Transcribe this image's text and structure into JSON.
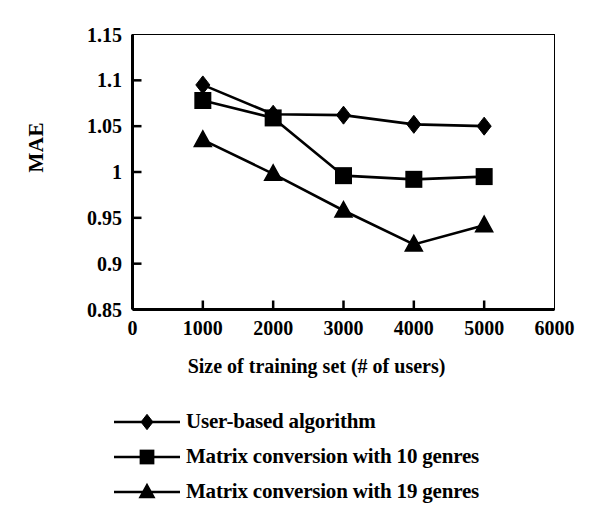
{
  "chart_data": {
    "type": "line",
    "title": "",
    "xlabel": "Size of training set (# of users)",
    "ylabel": "MAE",
    "x": [
      1000,
      2000,
      3000,
      4000,
      5000
    ],
    "xlim": [
      0,
      6000
    ],
    "ylim": [
      0.85,
      1.15
    ],
    "xticks": [
      "0",
      "1000",
      "2000",
      "3000",
      "4000",
      "5000",
      "6000"
    ],
    "xtick_values": [
      0,
      1000,
      2000,
      3000,
      4000,
      5000,
      6000
    ],
    "yticks": [
      "0.85",
      "0.9",
      "0.95",
      "1",
      "1.05",
      "1.1",
      "1.15"
    ],
    "ytick_values": [
      0.85,
      0.9,
      0.95,
      1.0,
      1.05,
      1.1,
      1.15
    ],
    "grid": false,
    "legend_position": "below",
    "series": [
      {
        "name": "User-based algorithm",
        "marker": "diamond",
        "color": "#000000",
        "values": [
          1.095,
          1.063,
          1.062,
          1.052,
          1.05
        ]
      },
      {
        "name": "Matrix conversion with 10 genres",
        "marker": "square",
        "color": "#000000",
        "values": [
          1.078,
          1.059,
          0.996,
          0.992,
          0.995
        ]
      },
      {
        "name": "Matrix conversion with 19 genres",
        "marker": "triangle",
        "color": "#000000",
        "values": [
          1.035,
          0.998,
          0.958,
          0.921,
          0.942
        ]
      }
    ]
  },
  "axes": {
    "y_title": "MAE",
    "x_title": "Size of training set (# of users)",
    "y_tick_labels": [
      "1.15",
      "1.1",
      "1.05",
      "1",
      "0.95",
      "0.9",
      "0.85"
    ],
    "x_tick_labels": [
      "0",
      "1000",
      "2000",
      "3000",
      "4000",
      "5000",
      "6000"
    ]
  },
  "legend": {
    "items": [
      {
        "label": "User-based algorithm",
        "marker": "diamond"
      },
      {
        "label": "Matrix conversion with 10 genres",
        "marker": "square"
      },
      {
        "label": "Matrix conversion with 19 genres",
        "marker": "triangle"
      }
    ]
  }
}
